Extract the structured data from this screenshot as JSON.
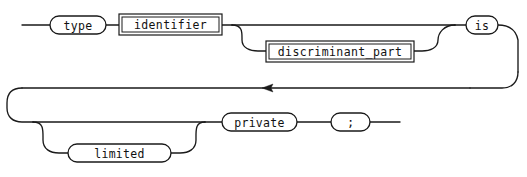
{
  "diagram": {
    "kind": "railroad-syntax-diagram",
    "rule_name": "type_declaration",
    "background_color": "#ffffff",
    "line_color": "#1a1a1a",
    "nodes": {
      "type": {
        "label": "type",
        "shape": "terminal-rounded"
      },
      "identifier": {
        "label": "identifier",
        "shape": "nonterminal-box"
      },
      "discriminant_part": {
        "label": "discriminant_part",
        "shape": "nonterminal-box"
      },
      "is": {
        "label": "is",
        "shape": "terminal-rounded"
      },
      "limited": {
        "label": "limited",
        "shape": "terminal-rounded"
      },
      "private": {
        "label": "private",
        "shape": "terminal-rounded"
      },
      "semicolon": {
        "label": ";",
        "shape": "terminal-rounded"
      }
    },
    "sequence_row_1": [
      "type",
      "identifier",
      "discriminant_part",
      "is"
    ],
    "sequence_row_2": [
      "limited",
      "private",
      "semicolon"
    ],
    "optional_branches": [
      "discriminant_part",
      "limited"
    ],
    "arrow_direction": "left"
  }
}
